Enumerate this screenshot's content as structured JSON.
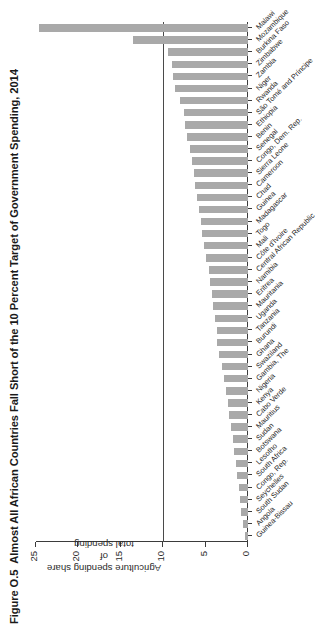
{
  "figure": {
    "number": "Figure O.5",
    "title": "Almost All African Countries Fall Short of the 10 Percent Target of Government Spending, 2014"
  },
  "axis": {
    "y_title_line1": "Agriculture spending share of",
    "y_title_line2": "total spending",
    "tick_labels": [
      "0",
      "5",
      "10",
      "15",
      "20",
      "25"
    ]
  },
  "annotations": {
    "target_value": 10,
    "target_label": "10 percent target"
  },
  "colors": {
    "bar_fill": "#a9a9a9",
    "axis": "#3b3b3b",
    "target_line": "#4a4a4a",
    "text": "#1f1f1f",
    "background": "#ffffff"
  },
  "chart_data": {
    "type": "bar",
    "title": "Almost All African Countries Fall Short of the 10 Percent Target of Government Spending, 2014",
    "xlabel": "",
    "ylabel": "Agriculture spending share of total spending",
    "ylim": [
      0,
      25
    ],
    "yticks": [
      0,
      5,
      10,
      15,
      20,
      25
    ],
    "grid": false,
    "legend": false,
    "orientation": "vertical",
    "reference_line": {
      "value": 10,
      "label": "10 percent target"
    },
    "categories": [
      "Guinea-Bissau",
      "Angola",
      "South Sudan",
      "Seychelles",
      "Congo, Rep.",
      "South Africa",
      "Lesotho",
      "Botswana",
      "Sudan",
      "Mauritius",
      "Cabo Verde",
      "Kenya",
      "Nigeria",
      "Gambia, The",
      "Swaziland",
      "Ghana",
      "Burundi",
      "Tanzania",
      "Uganda",
      "Mauritania",
      "Eritrea",
      "Namibia",
      "Central African Republic",
      "Côte d'Ivoire",
      "Mali",
      "Togo",
      "Madagascar",
      "Guinea",
      "Chad",
      "Cameroon",
      "Sierra Leone",
      "Congo, Dem. Rep.",
      "Senegal",
      "Benin",
      "Ethiopia",
      "São Tomé and Príncipe",
      "Rwanda",
      "Niger",
      "Zambia",
      "Zimbabwe",
      "Burkina Faso",
      "Mozambique",
      "Malawi"
    ],
    "values": [
      0.4,
      0.6,
      0.8,
      1.0,
      1.1,
      1.3,
      1.4,
      1.6,
      1.8,
      2.0,
      2.2,
      2.4,
      2.6,
      2.8,
      3.1,
      3.4,
      3.6,
      3.7,
      3.9,
      4.1,
      4.3,
      4.5,
      4.6,
      4.9,
      5.2,
      5.4,
      5.6,
      5.8,
      6.0,
      6.2,
      6.4,
      6.6,
      6.8,
      7.2,
      7.4,
      7.6,
      8.0,
      8.6,
      8.8,
      9.0,
      9.4,
      13.6,
      24.6
    ]
  }
}
